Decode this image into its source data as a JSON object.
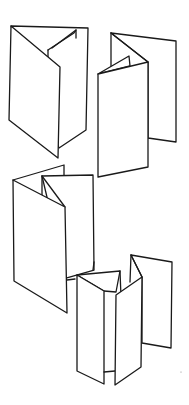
{
  "image": {
    "description": "Black line sketch of four folded paper brochures on a white background",
    "background_color": "#ffffff",
    "line_color": "#1a1a1a"
  },
  "drawings": [
    {
      "id": "trifold-top-left",
      "label": "Tri-fold brochure, partially open"
    },
    {
      "id": "gatefold-top-right",
      "label": "Folded brochure with panels opening"
    },
    {
      "id": "trifold-middle-left",
      "label": "Tri-fold brochure, angled view"
    },
    {
      "id": "accordion-bottom",
      "label": "Accordion-fold brochure standing upright"
    }
  ]
}
